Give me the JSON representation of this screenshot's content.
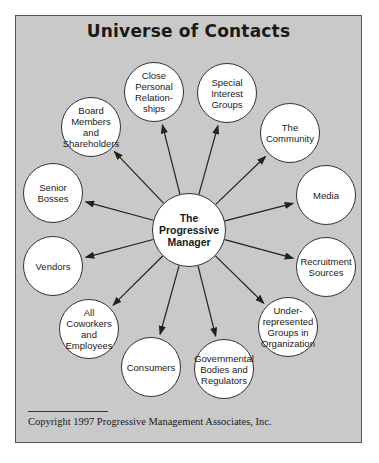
{
  "title": "Universe of Contacts",
  "center": {
    "label": "The\nProgressive\nManager",
    "x": 189,
    "y": 230,
    "r": 37
  },
  "nodes": [
    {
      "id": "close-personal",
      "label": "Close\nPersonal\nRelation-\nships",
      "x": 154,
      "y": 92,
      "r": 30
    },
    {
      "id": "special-interest",
      "label": "Special\nInterest\nGroups",
      "x": 227,
      "y": 93,
      "r": 30
    },
    {
      "id": "community",
      "label": "The\nCommunity",
      "x": 290,
      "y": 133,
      "r": 30
    },
    {
      "id": "media",
      "label": "Media",
      "x": 326,
      "y": 195,
      "r": 30
    },
    {
      "id": "recruitment",
      "label": "Recruitment\nSources",
      "x": 326,
      "y": 267,
      "r": 30
    },
    {
      "id": "underrepresented",
      "label": "Under-\nrepresented\nGroups in\nOrganization",
      "x": 288,
      "y": 327,
      "r": 30
    },
    {
      "id": "governmental",
      "label": "Governmental\nBodies and\nRegulators",
      "x": 224,
      "y": 369,
      "r": 30
    },
    {
      "id": "consumers",
      "label": "Consumers",
      "x": 151,
      "y": 367,
      "r": 30
    },
    {
      "id": "coworkers",
      "label": "All Coworkers\nand\nEmployees",
      "x": 89,
      "y": 329,
      "r": 30
    },
    {
      "id": "vendors",
      "label": "Vendors",
      "x": 53,
      "y": 266,
      "r": 30
    },
    {
      "id": "senior-bosses",
      "label": "Senior\nBosses",
      "x": 53,
      "y": 193,
      "r": 30
    },
    {
      "id": "board",
      "label": "Board\nMembers\nand\nShareholders",
      "x": 91,
      "y": 127,
      "r": 30
    }
  ],
  "copyright": "Copyright 1997 Progressive Management Associates, Inc.",
  "colors": {
    "background": "#c9c9c9",
    "node_fill": "#ffffff",
    "stroke": "#333333"
  }
}
